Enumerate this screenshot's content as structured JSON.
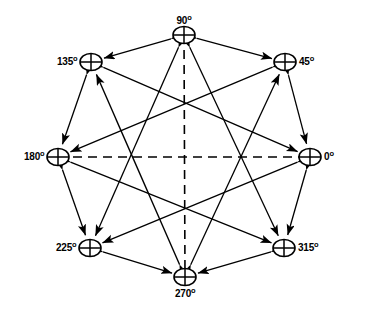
{
  "figure": {
    "background_color": "#ffffff",
    "stroke_color": "#000000",
    "node_symbol": "crossed-circle",
    "arrow_style": "double-headed-solid",
    "axis_style": "dashed"
  },
  "nodes": [
    {
      "id": "n0",
      "label": "0",
      "degree_symbol": "o",
      "angle_deg": 0,
      "cx": 310,
      "cy": 157,
      "label_side": "right"
    },
    {
      "id": "n45",
      "label": "45",
      "degree_symbol": "o",
      "angle_deg": 45,
      "cx": 285,
      "cy": 62,
      "label_side": "right"
    },
    {
      "id": "n90",
      "label": "90",
      "degree_symbol": "o",
      "angle_deg": 90,
      "cx": 184,
      "cy": 35,
      "label_side": "top"
    },
    {
      "id": "n135",
      "label": "135",
      "degree_symbol": "o",
      "angle_deg": 135,
      "cx": 91,
      "cy": 62,
      "label_side": "left"
    },
    {
      "id": "n180",
      "label": "180",
      "degree_symbol": "o",
      "angle_deg": 180,
      "cx": 58,
      "cy": 157,
      "label_side": "left"
    },
    {
      "id": "n225",
      "label": "225",
      "degree_symbol": "o",
      "angle_deg": 225,
      "cx": 90,
      "cy": 248,
      "label_side": "left"
    },
    {
      "id": "n270",
      "label": "270",
      "degree_symbol": "o",
      "angle_deg": 270,
      "cx": 185,
      "cy": 277,
      "label_side": "bottom"
    },
    {
      "id": "n315",
      "label": "315",
      "degree_symbol": "o",
      "angle_deg": 315,
      "cx": 284,
      "cy": 248,
      "label_side": "right"
    }
  ],
  "edges": [
    {
      "from": "n90",
      "to": "n135",
      "kind": "perimeter"
    },
    {
      "from": "n90",
      "to": "n45",
      "kind": "perimeter"
    },
    {
      "from": "n135",
      "to": "n180",
      "kind": "perimeter"
    },
    {
      "from": "n45",
      "to": "n0",
      "kind": "perimeter"
    },
    {
      "from": "n180",
      "to": "n225",
      "kind": "perimeter"
    },
    {
      "from": "n0",
      "to": "n315",
      "kind": "perimeter"
    },
    {
      "from": "n225",
      "to": "n270",
      "kind": "perimeter"
    },
    {
      "from": "n315",
      "to": "n270",
      "kind": "perimeter"
    },
    {
      "from": "n135",
      "to": "n0",
      "kind": "chord"
    },
    {
      "from": "n45",
      "to": "n180",
      "kind": "chord"
    },
    {
      "from": "n180",
      "to": "n315",
      "kind": "chord"
    },
    {
      "from": "n0",
      "to": "n225",
      "kind": "chord"
    },
    {
      "from": "n90",
      "to": "n225",
      "kind": "chord"
    },
    {
      "from": "n90",
      "to": "n315",
      "kind": "chord"
    },
    {
      "from": "n270",
      "to": "n135",
      "kind": "chord"
    },
    {
      "from": "n270",
      "to": "n45",
      "kind": "chord"
    }
  ],
  "axes": [
    {
      "id": "horizontal-axis",
      "x1": 58,
      "y1": 157,
      "x2": 310,
      "y2": 157
    },
    {
      "id": "vertical-axis",
      "x1": 184,
      "y1": 35,
      "x2": 185,
      "y2": 277
    }
  ]
}
